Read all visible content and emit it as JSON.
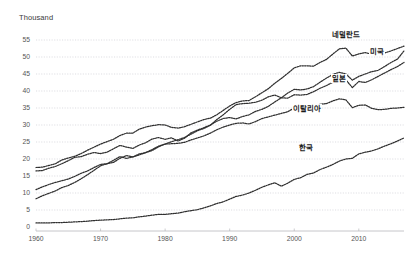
{
  "chart_data": {
    "type": "line",
    "title": "",
    "unit_label": "Thousand",
    "xlabel": "",
    "ylabel": "",
    "xlim": [
      1960,
      2017
    ],
    "ylim": [
      0,
      55
    ],
    "ytick_labels": [
      "0",
      "5",
      "10",
      "15",
      "20",
      "25",
      "30",
      "35",
      "40",
      "45",
      "50",
      "55"
    ],
    "ytick_values": [
      0,
      5,
      10,
      15,
      20,
      25,
      30,
      35,
      40,
      45,
      50,
      55
    ],
    "xtick_labels": [
      "1960",
      "1970",
      "1980",
      "1990",
      "2000",
      "2010"
    ],
    "xtick_values": [
      1960,
      1970,
      1980,
      1990,
      2000,
      2010
    ],
    "grid": true,
    "legend_position": "inline-end-of-line",
    "line_style": "dotted",
    "line_color": "#2f2f2f",
    "x": [
      1960,
      1961,
      1962,
      1963,
      1964,
      1965,
      1966,
      1967,
      1968,
      1969,
      1970,
      1971,
      1972,
      1973,
      1974,
      1975,
      1976,
      1977,
      1978,
      1979,
      1980,
      1981,
      1982,
      1983,
      1984,
      1985,
      1986,
      1987,
      1988,
      1989,
      1990,
      1991,
      1992,
      1993,
      1994,
      1995,
      1996,
      1997,
      1998,
      1999,
      2000,
      2001,
      2002,
      2003,
      2004,
      2005,
      2006,
      2007,
      2008,
      2009,
      2010,
      2011,
      2012,
      2013,
      2014,
      2015,
      2016,
      2017
    ],
    "series": [
      {
        "name": "네덜란드",
        "label": "네덜란드",
        "label_en": "Netherlands",
        "start_value": 17.5,
        "end_value": 53.2,
        "values": [
          17.5,
          17.6,
          18.1,
          18.6,
          19.7,
          20.3,
          20.8,
          21.6,
          22.6,
          23.5,
          24.4,
          25.1,
          25.8,
          26.9,
          27.6,
          27.6,
          28.8,
          29.4,
          29.8,
          30.1,
          30.0,
          29.3,
          29.1,
          29.5,
          30.2,
          30.9,
          31.6,
          32.0,
          33.0,
          34.3,
          35.6,
          36.6,
          37.1,
          37.2,
          38.3,
          39.5,
          40.7,
          42.3,
          43.7,
          45.2,
          46.8,
          47.4,
          47.4,
          47.3,
          48.4,
          49.3,
          50.9,
          52.4,
          52.6,
          50.3,
          50.9,
          51.3,
          50.8,
          50.6,
          51.2,
          51.8,
          52.5,
          53.2
        ]
      },
      {
        "name": "미국",
        "label": "미국",
        "label_en": "United States",
        "start_value": 16.5,
        "end_value": 51.8,
        "values": [
          16.5,
          16.6,
          17.3,
          17.8,
          18.6,
          19.5,
          20.5,
          20.7,
          21.4,
          21.9,
          21.6,
          22.0,
          23.0,
          24.0,
          23.5,
          23.1,
          24.1,
          24.8,
          25.9,
          26.3,
          25.8,
          26.2,
          25.3,
          26.1,
          27.7,
          28.5,
          29.2,
          30.0,
          31.1,
          31.9,
          32.2,
          31.8,
          32.5,
          33.0,
          34.0,
          34.6,
          35.5,
          36.8,
          38.0,
          39.4,
          40.5,
          40.3,
          40.6,
          41.3,
          42.6,
          43.8,
          44.9,
          45.5,
          45.0,
          43.2,
          44.3,
          45.0,
          45.7,
          46.1,
          47.2,
          48.4,
          49.4,
          51.8
        ]
      },
      {
        "name": "일본",
        "label": "일본",
        "label_en": "Japan",
        "start_value": 8.3,
        "end_value": 48.4,
        "values": [
          8.3,
          9.2,
          9.9,
          10.6,
          11.6,
          12.2,
          13.1,
          14.2,
          15.4,
          16.7,
          18.0,
          18.6,
          19.6,
          20.7,
          20.2,
          20.6,
          21.2,
          21.9,
          22.8,
          23.8,
          24.4,
          25.1,
          25.7,
          26.3,
          27.3,
          28.3,
          29.0,
          29.9,
          31.6,
          33.0,
          34.6,
          36.0,
          36.3,
          36.4,
          36.7,
          37.3,
          38.3,
          38.8,
          38.0,
          37.9,
          38.9,
          38.8,
          39.0,
          39.8,
          40.8,
          41.6,
          42.6,
          43.6,
          43.3,
          41.0,
          42.8,
          42.5,
          43.3,
          44.3,
          45.3,
          46.3,
          47.2,
          48.4
        ]
      },
      {
        "name": "이탈리아",
        "label": "이탈리아",
        "label_en": "Italy",
        "start_value": 11.0,
        "end_value": 35.2,
        "values": [
          11.0,
          11.8,
          12.5,
          13.1,
          13.6,
          14.1,
          14.9,
          15.8,
          16.5,
          17.5,
          18.4,
          18.6,
          19.0,
          20.2,
          21.0,
          20.6,
          21.5,
          21.9,
          22.5,
          23.6,
          24.4,
          24.5,
          24.6,
          24.9,
          25.6,
          26.2,
          26.8,
          27.6,
          28.6,
          29.4,
          30.0,
          30.5,
          30.6,
          30.3,
          31.0,
          31.9,
          32.4,
          32.9,
          33.4,
          33.9,
          35.0,
          35.6,
          35.6,
          35.6,
          36.1,
          36.3,
          37.1,
          37.7,
          37.4,
          35.1,
          35.8,
          35.9,
          34.9,
          34.5,
          34.6,
          34.9,
          35.0,
          35.2
        ]
      },
      {
        "name": "한국",
        "label": "한국",
        "label_en": "Korea",
        "start_value": 1.2,
        "end_value": 26.2,
        "values": [
          1.2,
          1.2,
          1.2,
          1.3,
          1.3,
          1.4,
          1.5,
          1.6,
          1.7,
          1.9,
          2.0,
          2.1,
          2.2,
          2.4,
          2.6,
          2.7,
          3.0,
          3.2,
          3.5,
          3.7,
          3.7,
          3.9,
          4.1,
          4.5,
          4.8,
          5.1,
          5.6,
          6.2,
          6.9,
          7.4,
          8.2,
          9.0,
          9.4,
          10.0,
          10.8,
          11.7,
          12.4,
          13.0,
          12.0,
          12.9,
          14.0,
          14.5,
          15.5,
          15.9,
          16.9,
          17.6,
          18.4,
          19.4,
          20.0,
          20.2,
          21.5,
          22.0,
          22.4,
          23.0,
          23.8,
          24.5,
          25.3,
          26.2
        ]
      }
    ],
    "annotations": [
      {
        "text": "네덜란드",
        "x_px": 331,
        "y_px": 30
      },
      {
        "text": "미국",
        "x_px": 369,
        "y_px": 47
      },
      {
        "text": "일본",
        "x_px": 331,
        "y_px": 74
      },
      {
        "text": "이탈리아",
        "x_px": 292,
        "y_px": 104
      },
      {
        "text": "한국",
        "x_px": 298,
        "y_px": 143
      }
    ]
  }
}
